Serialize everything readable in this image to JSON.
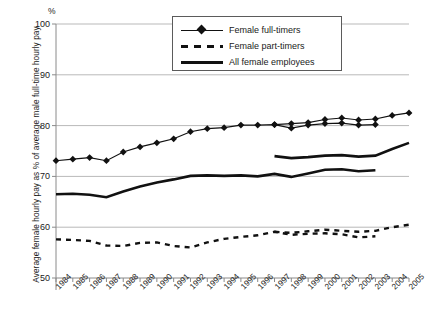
{
  "chart_data": {
    "type": "line",
    "title": "",
    "xlabel": "",
    "ylabel": "Average female hourly pay as % of average male full-time hourly pay",
    "yunit": "%",
    "ylim": [
      50,
      100
    ],
    "yticks": [
      50,
      60,
      70,
      80,
      90,
      100
    ],
    "grid": true,
    "legend_position": "top-center",
    "x": [
      1984,
      1985,
      1986,
      1987,
      1988,
      1989,
      1990,
      1991,
      1992,
      1993,
      1994,
      1995,
      1996,
      1997,
      1998,
      1999,
      2000,
      2001,
      2002,
      2003,
      2004,
      2005
    ],
    "categories": [
      "1984",
      "1985",
      "1986",
      "1987",
      "1988",
      "1989",
      "1990",
      "1991",
      "1992",
      "1993",
      "1994",
      "1995",
      "1996",
      "1997",
      "1998",
      "1999",
      "2000",
      "2001",
      "2002",
      "2003",
      "2004",
      "2005"
    ],
    "series": [
      {
        "name": "Female full-timers",
        "style": "line-with-diamond-markers",
        "x": [
          1984,
          1985,
          1986,
          1987,
          1988,
          1989,
          1990,
          1991,
          1992,
          1993,
          1994,
          1995,
          1996,
          1997,
          1998,
          1999,
          2000,
          2001,
          2002,
          2003
        ],
        "values": [
          73.1,
          73.4,
          73.7,
          73.1,
          74.8,
          75.8,
          76.6,
          77.4,
          78.8,
          79.4,
          79.6,
          80.1,
          80.1,
          80.2,
          79.5,
          80.1,
          80.4,
          80.5,
          80.1,
          80.2
        ]
      },
      {
        "name": "Female full-timers",
        "style": "line-with-diamond-markers",
        "note": "series continues after 1997 methodology change",
        "x": [
          1997,
          1998,
          1999,
          2000,
          2001,
          2002,
          2003,
          2004,
          2005
        ],
        "values": [
          80.2,
          80.4,
          80.6,
          81.2,
          81.5,
          81.1,
          81.3,
          82.0,
          82.5
        ]
      },
      {
        "name": "Female part-timers",
        "style": "dashed",
        "x": [
          1984,
          1985,
          1986,
          1987,
          1988,
          1989,
          1990,
          1991,
          1992,
          1993,
          1994,
          1995,
          1996,
          1997,
          1998,
          1999,
          2000,
          2001,
          2002,
          2003
        ],
        "values": [
          57.6,
          57.5,
          57.3,
          56.4,
          56.3,
          56.9,
          57.0,
          56.3,
          56.0,
          57.0,
          57.7,
          58.1,
          58.4,
          59.1,
          58.5,
          58.7,
          58.8,
          58.6,
          58.0,
          58.2
        ]
      },
      {
        "name": "Female part-timers",
        "style": "dashed",
        "note": "series continues after 1997 methodology change",
        "x": [
          1997,
          1998,
          1999,
          2000,
          2001,
          2002,
          2003,
          2004,
          2005
        ],
        "values": [
          59.1,
          58.9,
          59.2,
          59.5,
          59.3,
          59.1,
          59.3,
          60.0,
          60.5
        ]
      },
      {
        "name": "All female employees",
        "style": "thick-solid",
        "x": [
          1984,
          1985,
          1986,
          1987,
          1988,
          1989,
          1990,
          1991,
          1992,
          1993,
          1994,
          1995,
          1996,
          1997,
          1998,
          1999,
          2000,
          2001,
          2002,
          2003
        ],
        "values": [
          66.5,
          66.6,
          66.4,
          65.9,
          67.0,
          68.0,
          68.8,
          69.4,
          70.1,
          70.2,
          70.1,
          70.2,
          70.0,
          70.5,
          69.9,
          70.6,
          71.3,
          71.4,
          71.0,
          71.2
        ]
      },
      {
        "name": "All female employees",
        "style": "thick-solid",
        "note": "series continues after 1997 methodology change",
        "x": [
          1997,
          1998,
          1999,
          2000,
          2001,
          2002,
          2003,
          2004,
          2005
        ],
        "values": [
          74.0,
          73.6,
          73.8,
          74.1,
          74.2,
          73.9,
          74.1,
          75.4,
          76.6
        ]
      }
    ]
  },
  "legend": {
    "items": [
      {
        "label": "Female full-timers",
        "key": "line-marker"
      },
      {
        "label": "Female part-timers",
        "key": "dashed"
      },
      {
        "label": "All female employees",
        "key": "thick"
      }
    ]
  }
}
